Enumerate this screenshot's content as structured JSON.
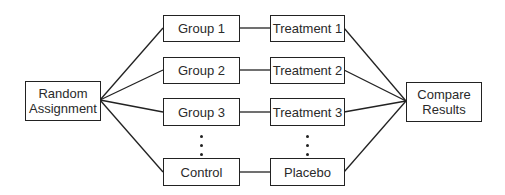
{
  "diagram": {
    "type": "flowchart",
    "source_node": {
      "id": "random",
      "label_line1": "Random",
      "label_line2": "Assignment"
    },
    "groups": [
      {
        "id": "g1",
        "label": "Group 1"
      },
      {
        "id": "g2",
        "label": "Group 2"
      },
      {
        "id": "g3",
        "label": "Group 3"
      },
      {
        "id": "ctrl",
        "label": "Control"
      }
    ],
    "treatments": [
      {
        "id": "t1",
        "label": "Treatment 1"
      },
      {
        "id": "t2",
        "label": "Treatment 2"
      },
      {
        "id": "t3",
        "label": "Treatment 3"
      },
      {
        "id": "plc",
        "label": "Placebo"
      }
    ],
    "sink_node": {
      "id": "compare",
      "label_line1": "Compare",
      "label_line2": "Results"
    },
    "edges": [
      [
        "random",
        "g1"
      ],
      [
        "random",
        "g2"
      ],
      [
        "random",
        "g3"
      ],
      [
        "random",
        "ctrl"
      ],
      [
        "g1",
        "t1"
      ],
      [
        "g2",
        "t2"
      ],
      [
        "g3",
        "t3"
      ],
      [
        "ctrl",
        "plc"
      ],
      [
        "t1",
        "compare"
      ],
      [
        "t2",
        "compare"
      ],
      [
        "t3",
        "compare"
      ],
      [
        "plc",
        "compare"
      ]
    ],
    "ellipsis_between": [
      "Group 3",
      "Control"
    ],
    "colors": {
      "stroke": "#222222",
      "text": "#2a2a2a",
      "background": "#ffffff"
    }
  }
}
